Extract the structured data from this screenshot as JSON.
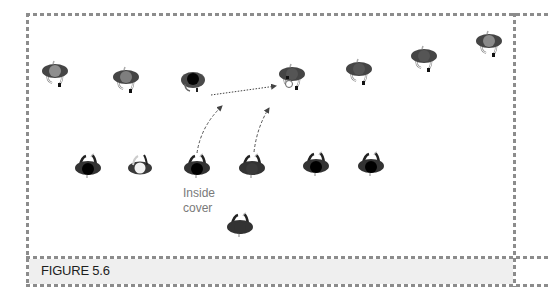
{
  "figure": {
    "caption": "FIGURE 5.6",
    "annotation": {
      "line1": "Inside",
      "line2": "cover"
    }
  },
  "colors": {
    "border": "#8c8c8c",
    "caption_bg": "#efefef",
    "player_shoulder": "#444444",
    "head_dark": "#000000",
    "head_gray": "#8a8a8a",
    "head_white": "#f2f2f2",
    "arrow": "#555555"
  },
  "players": {
    "attackers": [
      {
        "id": "a1",
        "x": 55,
        "y": 71,
        "head": "gray",
        "facing": "down"
      },
      {
        "id": "a2",
        "x": 126,
        "y": 77,
        "head": "gray",
        "facing": "down"
      },
      {
        "id": "a3",
        "x": 292,
        "y": 74,
        "head": "dark-gray",
        "facing": "down",
        "has_ball": true
      },
      {
        "id": "a4",
        "x": 359,
        "y": 69,
        "head": "dark-gray",
        "facing": "down"
      },
      {
        "id": "a5",
        "x": 424,
        "y": 56,
        "head": "dark-gray",
        "facing": "down"
      },
      {
        "id": "a6",
        "x": 489,
        "y": 41,
        "head": "gray",
        "facing": "down"
      }
    ],
    "defenders": [
      {
        "id": "d1",
        "x": 193,
        "y": 80,
        "head": "black",
        "facing": "up"
      },
      {
        "id": "d2",
        "x": 88,
        "y": 167,
        "head": "black",
        "facing": "up"
      },
      {
        "id": "d3",
        "x": 140,
        "y": 167,
        "head": "white",
        "facing": "up"
      },
      {
        "id": "d4",
        "x": 197,
        "y": 167,
        "head": "black",
        "facing": "up"
      },
      {
        "id": "d5",
        "x": 252,
        "y": 167,
        "head": "dark-gray",
        "facing": "up"
      },
      {
        "id": "d6",
        "x": 316,
        "y": 165,
        "head": "black",
        "facing": "up"
      },
      {
        "id": "d7",
        "x": 371,
        "y": 165,
        "head": "black",
        "facing": "up"
      },
      {
        "id": "d8",
        "x": 240,
        "y": 226,
        "head": "dark-gray",
        "facing": "up"
      }
    ]
  },
  "arrows": [
    {
      "type": "pass",
      "style": "dotted",
      "from": [
        210,
        95
      ],
      "to": [
        276,
        86
      ]
    },
    {
      "type": "run",
      "style": "dashed",
      "from": [
        196,
        152
      ],
      "to": [
        222,
        106
      ]
    },
    {
      "type": "run",
      "style": "dashed",
      "from": [
        254,
        151
      ],
      "to": [
        270,
        108
      ]
    }
  ]
}
